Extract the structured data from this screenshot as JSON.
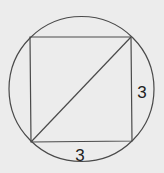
{
  "diagram": {
    "background_color": "#ececec",
    "stroke_color": "#4a4a4a",
    "text_color": "#222222",
    "circle": {
      "cx": 81.5,
      "cy": 89,
      "r": 72.5
    },
    "square": {
      "top_left": [
        30,
        37
      ],
      "top_right": [
        131,
        37
      ],
      "bottom_right": [
        132,
        141
      ],
      "bottom_left": [
        31,
        142
      ]
    },
    "diagonal": {
      "from": [
        31,
        142
      ],
      "to": [
        131,
        37
      ]
    },
    "labels": {
      "right_side": "3",
      "bottom_side": "3"
    }
  }
}
